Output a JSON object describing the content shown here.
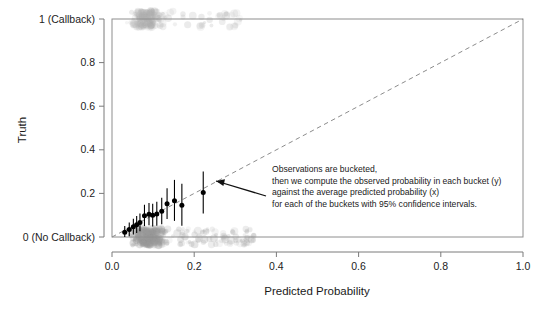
{
  "chart_data": {
    "type": "scatter",
    "title": "",
    "xlabel": "Predicted Probability",
    "ylabel": "Truth",
    "xlim": [
      0.0,
      1.0
    ],
    "ylim": [
      0.0,
      1.0
    ],
    "grid": false,
    "legend_position": "none",
    "x_ticks": [
      0.0,
      0.2,
      0.4,
      0.6,
      0.8,
      1.0
    ],
    "x_tick_labels": [
      "0.0",
      "0.2",
      "0.4",
      "0.6",
      "0.8",
      "1.0"
    ],
    "y_ticks": [
      0.0,
      0.2,
      0.4,
      0.6,
      0.8,
      1.0
    ],
    "y_tick_labels": [
      "0 (No Callback)",
      "0.2",
      "0.4",
      "0.6",
      "0.8",
      "1 (Callback)"
    ],
    "series": [
      {
        "name": "bucketed observed probability",
        "type": "scatter_with_errorbars",
        "color": "#000000",
        "points": [
          {
            "x": 0.031,
            "y": 0.022,
            "ylow": 0.0,
            "yhigh": 0.05
          },
          {
            "x": 0.042,
            "y": 0.034,
            "ylow": 0.004,
            "yhigh": 0.066
          },
          {
            "x": 0.052,
            "y": 0.047,
            "ylow": 0.012,
            "yhigh": 0.084
          },
          {
            "x": 0.06,
            "y": 0.056,
            "ylow": 0.018,
            "yhigh": 0.096
          },
          {
            "x": 0.068,
            "y": 0.066,
            "ylow": 0.026,
            "yhigh": 0.108
          },
          {
            "x": 0.079,
            "y": 0.098,
            "ylow": 0.05,
            "yhigh": 0.148
          },
          {
            "x": 0.09,
            "y": 0.104,
            "ylow": 0.054,
            "yhigh": 0.156
          },
          {
            "x": 0.099,
            "y": 0.1,
            "ylow": 0.048,
            "yhigh": 0.152
          },
          {
            "x": 0.109,
            "y": 0.106,
            "ylow": 0.052,
            "yhigh": 0.162
          },
          {
            "x": 0.121,
            "y": 0.118,
            "ylow": 0.058,
            "yhigh": 0.18
          },
          {
            "x": 0.134,
            "y": 0.152,
            "ylow": 0.082,
            "yhigh": 0.224
          },
          {
            "x": 0.152,
            "y": 0.166,
            "ylow": 0.074,
            "yhigh": 0.262
          },
          {
            "x": 0.17,
            "y": 0.146,
            "ylow": 0.052,
            "yhigh": 0.244
          },
          {
            "x": 0.222,
            "y": 0.204,
            "ylow": 0.108,
            "yhigh": 0.3
          }
        ]
      },
      {
        "name": "raw observations (jittered, y = 1)",
        "type": "jitter_rug",
        "color": "#b0b0b0",
        "y_center": 1.0,
        "x_range": [
          0.015,
          0.315
        ],
        "x_dense_range": [
          0.035,
          0.135
        ]
      },
      {
        "name": "raw observations (jittered, y = 0)",
        "type": "jitter_rug",
        "color": "#9a9a9a",
        "y_center": 0.0,
        "x_range": [
          0.015,
          0.345
        ],
        "x_dense_range": [
          0.03,
          0.15
        ]
      }
    ],
    "reference_line": {
      "name": "perfect calibration diagonal",
      "style": "dashed",
      "color": "#8c8c8c",
      "from": [
        0.0,
        0.0
      ],
      "to": [
        1.0,
        1.0
      ]
    },
    "annotation": {
      "target_point": {
        "x": 0.222,
        "y": 0.204
      },
      "lines": [
        "Observations are bucketed,",
        "then we compute the observed probability in each bucket (y)",
        "against the average predicted probability (x)",
        "for each of the buckets with 95% confidence intervals."
      ]
    }
  }
}
